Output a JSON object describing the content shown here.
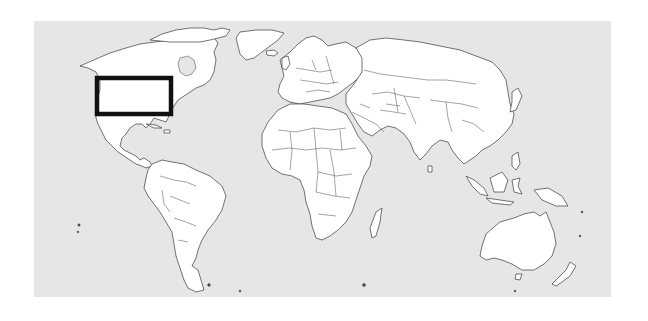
{
  "map": {
    "projection": "equirectangular world",
    "colors": {
      "ocean": "#e6e6e6",
      "land": "#ffffff",
      "outline": "#3a3a3a",
      "highlight": "#111111"
    },
    "frame": {
      "x": 34,
      "y": 21,
      "width": 577,
      "height": 276
    },
    "highlight_region": {
      "label": "",
      "area": "central / north-eastern United States",
      "x": 97,
      "y": 78,
      "width": 74,
      "height": 36
    },
    "continents": [
      "North America",
      "Greenland",
      "South America",
      "Europe",
      "Africa",
      "Asia",
      "Australia",
      "New Zealand",
      "Madagascar",
      "Indonesia",
      "Japan"
    ]
  }
}
